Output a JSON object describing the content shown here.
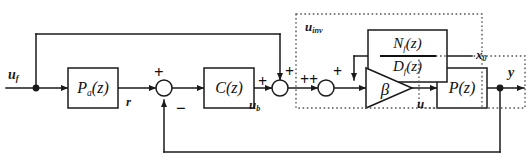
{
  "diagram": {
    "stroke_color": "#1a1a1a",
    "dotted_color": "#555555",
    "background": "#ffffff"
  },
  "signals": {
    "input": "u",
    "input_sub": "f",
    "reference": "r",
    "controller_out": "u",
    "controller_out_sub": "b",
    "inverse_signal": "u",
    "inverse_signal_sub": "inv",
    "init_state": "x",
    "init_state_sub": "0",
    "plant_in": "u",
    "output": "y"
  },
  "blocks": [
    {
      "id": "pa",
      "label": "P",
      "sub": "a",
      "arg": "(z)",
      "kind": "rect"
    },
    {
      "id": "c",
      "label": "C",
      "sub": "",
      "arg": "(z)",
      "kind": "rect"
    },
    {
      "id": "beta",
      "label": "β",
      "sub": "",
      "arg": "",
      "kind": "triangle"
    },
    {
      "id": "p",
      "label": "P",
      "sub": "",
      "arg": "(z)",
      "kind": "rect"
    }
  ],
  "filter_block": {
    "numerator": "N",
    "numerator_sub": "f",
    "numerator_arg": "(z)",
    "denominator": "D",
    "denominator_sub": "f",
    "denominator_arg": "(z)"
  },
  "summing_junctions": [
    {
      "id": "sum-r",
      "signs": {
        "left": "+",
        "bottom": "−"
      }
    },
    {
      "id": "sum-ub",
      "signs": {
        "left": "+",
        "top": "+",
        "right": "+"
      }
    },
    {
      "id": "sum-inv",
      "signs": {
        "left": "+",
        "top": "+"
      }
    }
  ],
  "dotted_regions": [
    {
      "id": "inverse-compensator-region"
    },
    {
      "id": "plant-region"
    }
  ]
}
